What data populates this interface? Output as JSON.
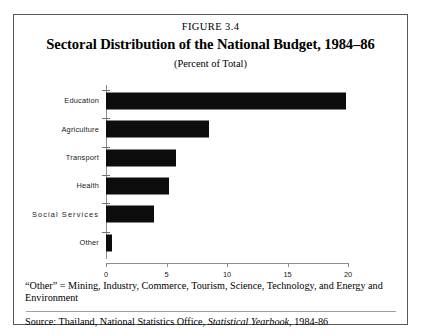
{
  "figure": {
    "number_label": "FIGURE 3.4",
    "title": "Sectoral Distribution of the National Budget, 1984–86",
    "subtitle": "(Percent of Total)"
  },
  "notes": {
    "footnote": "“Other” = Mining, Industry, Commerce, Tourism, Science, Technology, and Energy and Environment",
    "source_prefix": "Source: Thailand, National Statistics Office, ",
    "source_italic": "Statistical Yearbook",
    "source_suffix": ", 1984-86"
  },
  "chart_data": {
    "type": "bar",
    "orientation": "horizontal",
    "title": "Sectoral Distribution of the National Budget, 1984–86",
    "subtitle": "(Percent of Total)",
    "xlabel": "",
    "ylabel": "",
    "categories": [
      "Education",
      "Agriculture",
      "Transport",
      "Health",
      "Social  Services",
      "Other"
    ],
    "values": [
      19.8,
      8.5,
      5.8,
      5.2,
      4.0,
      0.5
    ],
    "xlim": [
      0,
      20
    ],
    "xticks": [
      0,
      5,
      10,
      15,
      20
    ],
    "xtick_labels": [
      "0",
      "5",
      "10",
      "15",
      "20"
    ],
    "grid": false,
    "legend": false,
    "bar_color": "#0d0d0d",
    "axis_color": "#8a8f93"
  }
}
